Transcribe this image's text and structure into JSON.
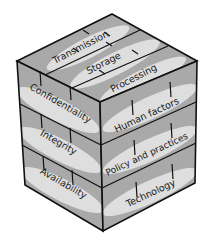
{
  "diagram": {
    "type": "security-cube",
    "top_face": {
      "labels": [
        "Transmission",
        "Storage",
        "Processing"
      ]
    },
    "left_face": {
      "labels": [
        "Confidentiality",
        "Integrity",
        "Availability"
      ]
    },
    "right_face": {
      "labels": [
        "Human factors",
        "Policy and practices",
        "Technology"
      ]
    },
    "colors": {
      "face_fill": "#a9a9a9",
      "band_fill": "#dcdcdc",
      "edge": "#111111"
    }
  }
}
